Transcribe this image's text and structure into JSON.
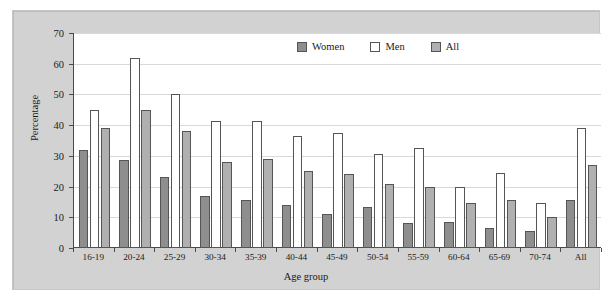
{
  "chart_data": {
    "type": "bar",
    "title": "",
    "xlabel": "Age group",
    "ylabel": "Percentage",
    "ylim": [
      0,
      70
    ],
    "yticks": [
      0,
      10,
      20,
      30,
      40,
      50,
      60,
      70
    ],
    "grid": true,
    "legend_position": "top-center",
    "categories": [
      "16-19",
      "20-24",
      "25-29",
      "30-34",
      "35-39",
      "40-44",
      "45-49",
      "50-54",
      "55-59",
      "60-64",
      "65-69",
      "70-74",
      "All"
    ],
    "series": [
      {
        "name": "Women",
        "color": "#8e8e8e",
        "values": [
          32,
          28.5,
          23,
          17,
          15.5,
          14,
          11,
          13.5,
          8,
          8.5,
          6.5,
          5.5,
          15.5
        ]
      },
      {
        "name": "Men",
        "color": "#ffffff",
        "values": [
          45,
          62,
          50,
          41.5,
          41.5,
          36.5,
          37.5,
          30.5,
          32.5,
          20,
          24.5,
          14.5,
          39
        ]
      },
      {
        "name": "All",
        "color": "#b0b0b0",
        "values": [
          39,
          45,
          38,
          28,
          29,
          25,
          24,
          21,
          20,
          14.5,
          15.5,
          10,
          27
        ]
      }
    ]
  },
  "legend": {
    "items": [
      {
        "label": "Women",
        "swatch": "women"
      },
      {
        "label": "Men",
        "swatch": "men"
      },
      {
        "label": "All",
        "swatch": "all"
      }
    ]
  },
  "colors": {
    "panel_background": "#d2d2d2",
    "plot_background": "#ffffff",
    "axis": "#4a4a4a",
    "gridline": "#d9d9d9",
    "women": "#8e8e8e",
    "men": "#ffffff",
    "all": "#b0b0b0"
  }
}
